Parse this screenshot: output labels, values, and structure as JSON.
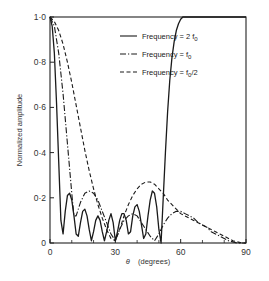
{
  "chart_data": {
    "type": "line",
    "title": "",
    "xlabel": "θ (degrees)",
    "ylabel": "Normalized amplitude",
    "xlim": [
      0,
      90
    ],
    "ylim": [
      0,
      1.0
    ],
    "xticks": [
      0,
      30,
      60,
      90
    ],
    "xtick_labels": [
      "0",
      "30",
      "60",
      "90"
    ],
    "xminor_ticks": [
      10,
      20,
      40,
      50,
      70,
      80
    ],
    "yticks": [
      0,
      0.2,
      0.4,
      0.6,
      0.8,
      1.0
    ],
    "ytick_labels": [
      "0",
      "0·2",
      "0·4",
      "0·6",
      "0·8",
      "1·0"
    ],
    "grid": false,
    "legend_position": "upper right (inside)",
    "series": [
      {
        "name": "Frequency = 2 f0",
        "style": "solid",
        "x": [
          0,
          1,
          2,
          3,
          4,
          5,
          6,
          7,
          8,
          9,
          10,
          11,
          12,
          13,
          14,
          15,
          16,
          17,
          18,
          19,
          20,
          21,
          22,
          23,
          24,
          25,
          26,
          27,
          28,
          29,
          30,
          31,
          32,
          33,
          34,
          35,
          36,
          37,
          38,
          39,
          40,
          41,
          42,
          43,
          44,
          45,
          46,
          47,
          48,
          49,
          50,
          51,
          52,
          53,
          54,
          55,
          56,
          57,
          58,
          59,
          60,
          61,
          62,
          63,
          64,
          65,
          66,
          67,
          68,
          69,
          70,
          72,
          74,
          76,
          78,
          80,
          82,
          84,
          86,
          88,
          90
        ],
        "values": [
          1.0,
          0.96,
          0.84,
          0.62,
          0.36,
          0.1,
          0.04,
          0.14,
          0.21,
          0.22,
          0.19,
          0.12,
          0.04,
          0.03,
          0.09,
          0.14,
          0.15,
          0.12,
          0.06,
          0.01,
          0.05,
          0.1,
          0.12,
          0.1,
          0.05,
          0.01,
          0.05,
          0.1,
          0.13,
          0.09,
          0.01,
          0.05,
          0.1,
          0.13,
          0.13,
          0.1,
          0.04,
          0.05,
          0.12,
          0.16,
          0.17,
          0.14,
          0.08,
          0.02,
          0.04,
          0.12,
          0.19,
          0.23,
          0.22,
          0.16,
          0.06,
          0.0,
          0.2,
          0.4,
          0.58,
          0.72,
          0.82,
          0.89,
          0.94,
          0.97,
          0.99,
          1.0,
          1.0,
          1.0,
          1.0,
          1.0,
          1.0,
          1.0,
          1.0,
          1.0,
          1.0,
          1.0,
          1.0,
          1.0,
          1.0,
          1.0,
          1.0,
          1.0,
          1.0,
          1.0,
          1.0
        ]
      },
      {
        "name": "Frequency = f0",
        "style": "dash-dot",
        "x": [
          0,
          2,
          4,
          6,
          8,
          10,
          11,
          12,
          14,
          16,
          18,
          20,
          22,
          24,
          26,
          28,
          30,
          32,
          34,
          36,
          38,
          40,
          42,
          44,
          46,
          48,
          50,
          52,
          54,
          56,
          58,
          60,
          62,
          64,
          66,
          68,
          70,
          72,
          74,
          76,
          78,
          80,
          82,
          84,
          86,
          88,
          90
        ],
        "values": [
          1.0,
          0.96,
          0.84,
          0.66,
          0.44,
          0.22,
          0.12,
          0.12,
          0.18,
          0.22,
          0.23,
          0.22,
          0.19,
          0.14,
          0.09,
          0.04,
          0.01,
          0.06,
          0.1,
          0.12,
          0.13,
          0.12,
          0.09,
          0.06,
          0.03,
          0.01,
          0.04,
          0.08,
          0.11,
          0.13,
          0.14,
          0.14,
          0.13,
          0.12,
          0.11,
          0.09,
          0.08,
          0.07,
          0.05,
          0.04,
          0.03,
          0.02,
          0.01,
          0.005,
          0.0,
          0.0,
          0.0
        ]
      },
      {
        "name": "Frequency = f0/2",
        "style": "dashed",
        "x": [
          0,
          2,
          4,
          6,
          8,
          10,
          12,
          14,
          16,
          18,
          20,
          22,
          24,
          26,
          28,
          30,
          32,
          34,
          36,
          38,
          40,
          42,
          44,
          46,
          48,
          50,
          52,
          54,
          56,
          58,
          60,
          62,
          64,
          66,
          68,
          70,
          72,
          74,
          76,
          78,
          80,
          82,
          84,
          86,
          88,
          90
        ],
        "values": [
          1.0,
          0.98,
          0.94,
          0.88,
          0.8,
          0.71,
          0.61,
          0.51,
          0.41,
          0.32,
          0.24,
          0.17,
          0.11,
          0.06,
          0.02,
          0.01,
          0.06,
          0.12,
          0.17,
          0.21,
          0.24,
          0.26,
          0.27,
          0.27,
          0.26,
          0.24,
          0.22,
          0.19,
          0.17,
          0.15,
          0.13,
          0.12,
          0.11,
          0.1,
          0.09,
          0.08,
          0.07,
          0.06,
          0.05,
          0.04,
          0.03,
          0.02,
          0.01,
          0.005,
          0.0,
          0.0
        ]
      }
    ]
  },
  "legend": {
    "items": [
      {
        "label": "Frequency = 2 f",
        "sub": "0",
        "suffix": "",
        "style": "solid"
      },
      {
        "label": "Frequency = f",
        "sub": "0",
        "suffix": "",
        "style": "dash-dot"
      },
      {
        "label": "Frequency = f",
        "sub": "0",
        "suffix": "/2",
        "style": "dashed"
      }
    ]
  },
  "axes": {
    "xlabel_symbol": "θ",
    "xlabel_unit": "(degrees)",
    "ylabel": "Normalized amplitude"
  },
  "colors": {
    "line": "#1a1a1a",
    "axis": "#222222",
    "background": "#ffffff"
  }
}
